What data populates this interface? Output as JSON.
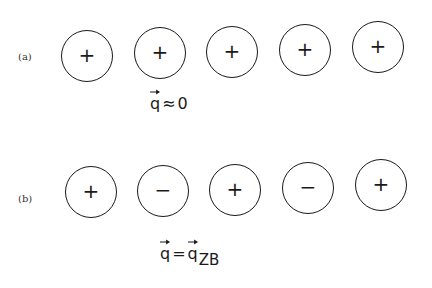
{
  "figure": {
    "rows": [
      {
        "id": "a",
        "label": "(a)",
        "ions": [
          {
            "charge": "+",
            "cx": 87,
            "cy": 56
          },
          {
            "charge": "+",
            "cx": 160,
            "cy": 53
          },
          {
            "charge": "+",
            "cx": 232,
            "cy": 52
          },
          {
            "charge": "+",
            "cx": 305,
            "cy": 50
          },
          {
            "charge": "+",
            "cx": 378,
            "cy": 47
          }
        ],
        "equation": {
          "lhs": "q",
          "operator": "≈",
          "rhs": "0",
          "rhs_subscript": ""
        }
      },
      {
        "id": "b",
        "label": "(b)",
        "ions": [
          {
            "charge": "+",
            "cx": 91,
            "cy": 192
          },
          {
            "charge": "−",
            "cx": 163,
            "cy": 191
          },
          {
            "charge": "+",
            "cx": 235,
            "cy": 190
          },
          {
            "charge": "−",
            "cx": 308,
            "cy": 188
          },
          {
            "charge": "+",
            "cx": 381,
            "cy": 185
          }
        ],
        "equation": {
          "lhs": "q",
          "operator": "=",
          "rhs": "q",
          "rhs_subscript": "ZB"
        }
      }
    ],
    "colors": {
      "stroke": "#1a1a1a",
      "background": "#ffffff"
    }
  }
}
